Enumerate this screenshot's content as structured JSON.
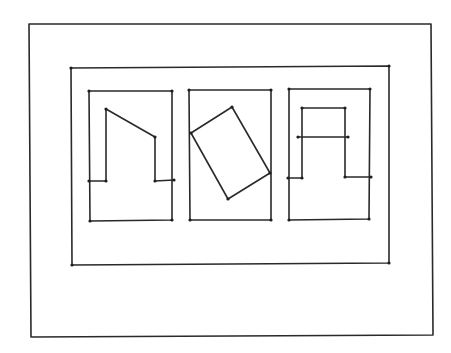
{
  "diagram": {
    "width": 451,
    "height": 353,
    "background": "#ffffff",
    "stroke_color": "#2a2a2a",
    "outer_frame": [
      [
        29,
        24
      ],
      [
        431,
        24
      ],
      [
        433,
        335
      ],
      [
        31,
        337
      ]
    ],
    "inner_frame": [
      [
        71,
        68
      ],
      [
        389,
        66
      ],
      [
        389,
        263
      ],
      [
        72,
        265
      ]
    ],
    "panels": [
      {
        "name": "panel-left",
        "frame": [
          [
            89,
            91
          ],
          [
            172,
            91
          ],
          [
            172,
            220
          ],
          [
            90,
            221
          ]
        ],
        "shapes": [
          {
            "name": "slanted-notch-shape",
            "closed": false,
            "points": [
              [
                89,
                181
              ],
              [
                106,
                181
              ],
              [
                106,
                109
              ],
              [
                155,
                137
              ],
              [
                155,
                181
              ],
              [
                174,
                180
              ]
            ]
          }
        ]
      },
      {
        "name": "panel-middle",
        "frame": [
          [
            189,
            90
          ],
          [
            271,
            90
          ],
          [
            271,
            220
          ],
          [
            190,
            220
          ]
        ],
        "shapes": [
          {
            "name": "rotated-rectangle-shape",
            "closed": true,
            "points": [
              [
                191,
                133
              ],
              [
                232,
                107
              ],
              [
                270,
                173
              ],
              [
                228,
                199
              ]
            ]
          }
        ]
      },
      {
        "name": "panel-right",
        "frame": [
          [
            289,
            89
          ],
          [
            370,
            89
          ],
          [
            369,
            219
          ],
          [
            289,
            220
          ]
        ],
        "shapes": [
          {
            "name": "arch-shape",
            "closed": false,
            "points": [
              [
                288,
                178
              ],
              [
                302,
                178
              ],
              [
                302,
                108
              ],
              [
                345,
                108
              ],
              [
                345,
                177
              ],
              [
                371,
                177
              ]
            ]
          },
          {
            "name": "crossbar-line",
            "closed": false,
            "points": [
              [
                298,
                137
              ],
              [
                348,
                137
              ]
            ]
          }
        ]
      }
    ]
  }
}
